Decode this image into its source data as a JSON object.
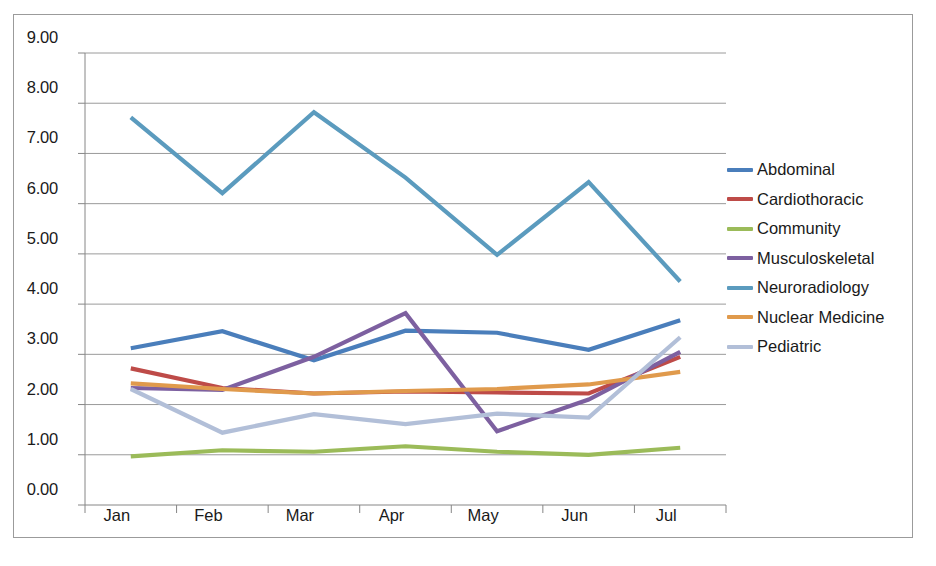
{
  "chart_data": {
    "type": "line",
    "title": "",
    "xlabel": "",
    "ylabel": "",
    "categories": [
      "Jan",
      "Feb",
      "Mar",
      "Apr",
      "May",
      "Jun",
      "Jul"
    ],
    "ylim": [
      0,
      9
    ],
    "ytick_step": 1,
    "ytick_labels": [
      "0.00",
      "1.00",
      "2.00",
      "3.00",
      "4.00",
      "5.00",
      "6.00",
      "7.00",
      "8.00",
      "9.00"
    ],
    "grid": "horizontal",
    "legend_position": "right",
    "series": [
      {
        "name": "Abdominal",
        "color": "#4A7EBB",
        "values": [
          3.12,
          3.46,
          2.88,
          3.47,
          3.43,
          3.09,
          3.68
        ]
      },
      {
        "name": "Cardiothoracic",
        "color": "#BE4B48",
        "values": [
          2.72,
          2.33,
          2.22,
          2.26,
          2.24,
          2.22,
          2.95
        ]
      },
      {
        "name": "Community",
        "color": "#9BBB59",
        "values": [
          0.97,
          1.09,
          1.06,
          1.17,
          1.06,
          1.0,
          1.14
        ]
      },
      {
        "name": "Musculoskeletal",
        "color": "#7D60A0",
        "values": [
          2.33,
          2.29,
          2.95,
          3.82,
          1.47,
          2.1,
          3.05
        ]
      },
      {
        "name": "Neuroradiology",
        "color": "#5B9BBE",
        "values": [
          7.72,
          6.21,
          7.82,
          6.52,
          4.98,
          6.43,
          4.45
        ]
      },
      {
        "name": "Nuclear Medicine",
        "color": "#E09A4C",
        "values": [
          2.42,
          2.31,
          2.22,
          2.27,
          2.31,
          2.4,
          2.65
        ]
      },
      {
        "name": "Pediatric",
        "color": "#B2BFD8",
        "values": [
          2.31,
          1.44,
          1.81,
          1.61,
          1.82,
          1.74,
          3.34
        ]
      }
    ]
  }
}
